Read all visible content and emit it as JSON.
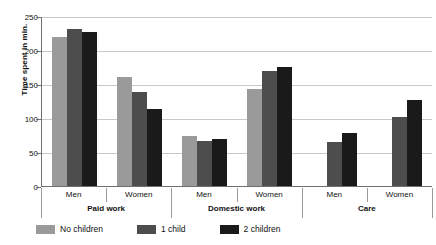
{
  "chart_data": {
    "type": "bar",
    "title": "",
    "xlabel": "",
    "ylabel": "Time spent in min.",
    "ylim": [
      0,
      250
    ],
    "yticks": [
      0,
      50,
      100,
      150,
      200,
      250
    ],
    "grid": true,
    "legend_position": "bottom-left",
    "categories": [
      "Men",
      "Women",
      "Men",
      "Women",
      "Men",
      "Women"
    ],
    "supercategories": [
      "Paid work",
      "Domestic work",
      "Care"
    ],
    "series": [
      {
        "name": "No children",
        "color": "#9a9a9a",
        "values": [
          220,
          162,
          75,
          144,
          null,
          null
        ]
      },
      {
        "name": "1 child",
        "color": "#4d4d4d",
        "values": [
          233,
          140,
          68,
          170,
          66,
          103
        ]
      },
      {
        "name": "2 children",
        "color": "#1a1a1a",
        "values": [
          228,
          115,
          70,
          176,
          80,
          128
        ]
      }
    ]
  },
  "axis": {
    "y_label": "Time spent in min.",
    "y_ticks": [
      "250",
      "200",
      "150",
      "100",
      "50",
      "0"
    ]
  },
  "groups": [
    {
      "label": "Men",
      "super": "Paid work"
    },
    {
      "label": "Women",
      "super": "Paid work"
    },
    {
      "label": "Men",
      "super": "Domestic work"
    },
    {
      "label": "Women",
      "super": "Domestic work"
    },
    {
      "label": "Men",
      "super": "Care"
    },
    {
      "label": "Women",
      "super": "Care"
    }
  ],
  "supergroups": [
    {
      "label": "Paid work"
    },
    {
      "label": "Domestic work"
    },
    {
      "label": "Care"
    }
  ],
  "legend": [
    {
      "label": "No children",
      "color": "#9a9a9a"
    },
    {
      "label": "1 child",
      "color": "#4d4d4d"
    },
    {
      "label": "2 children",
      "color": "#1a1a1a"
    }
  ]
}
